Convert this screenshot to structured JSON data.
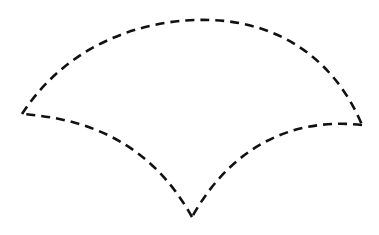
{
  "diagram": {
    "shape": "curved-triangle (fan / spherical triangle outline)",
    "stroke_color": "#111111",
    "background_color": "#ffffff",
    "line_style": "dashed",
    "dash_pattern": "9 6",
    "vertices": {
      "left": [
        22,
        114
      ],
      "right": [
        362,
        125
      ],
      "bottom": [
        192,
        217
      ]
    },
    "edges": [
      {
        "name": "top-arc",
        "from": "left",
        "to": "right",
        "path": "M22,114 C70,40 150,18 210,20 C280,22 335,60 362,125"
      },
      {
        "name": "lower-right-arc",
        "from": "right",
        "to": "bottom",
        "path": "M362,125 C300,118 235,140 192,217"
      },
      {
        "name": "lower-left-arc",
        "from": "bottom",
        "to": "left",
        "path": "M192,217 C160,160 110,120 22,114"
      }
    ]
  }
}
